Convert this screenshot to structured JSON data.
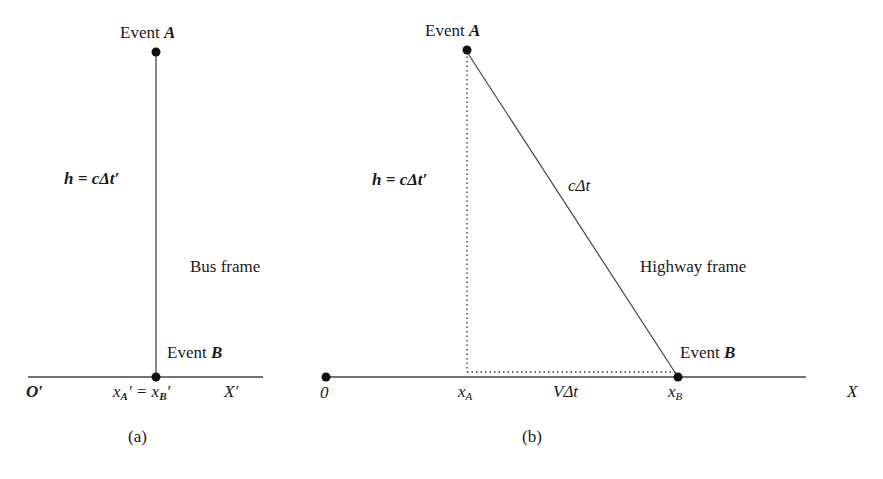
{
  "panel_a": {
    "event_a_label": "Event",
    "event_a_var": "A",
    "height_label": "h = cΔt′",
    "frame_label": "Bus frame",
    "event_b_label": "Event",
    "event_b_var": "B",
    "origin_label": "O′",
    "position_label": "x",
    "position_sub_a": "A",
    "position_eq": "′ = x",
    "position_sub_b": "B",
    "position_prime": "′",
    "axis_label": "X′",
    "caption": "(a)"
  },
  "panel_b": {
    "event_a_label": "Event",
    "event_a_var": "A",
    "height_label": "h = cΔt′",
    "hypotenuse_label": "cΔt",
    "frame_label": "Highway frame",
    "event_b_label": "Event",
    "event_b_var": "B",
    "origin_label": "0",
    "xa_label": "x",
    "xa_sub": "A",
    "distance_label": "VΔt",
    "xb_label": "x",
    "xb_sub": "B",
    "axis_label": "X",
    "caption": "(b)"
  },
  "colors": {
    "line": "#333333",
    "text": "#1a1a1a",
    "background": "#ffffff"
  }
}
